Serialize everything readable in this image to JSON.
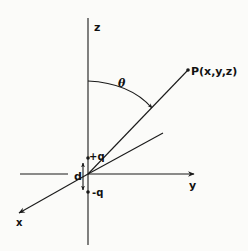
{
  "diagram": {
    "title": "",
    "labels": {
      "z_axis": "z",
      "y_axis": "y",
      "x_axis": "x",
      "point": "P(x,y,z)",
      "angle": "θ",
      "positive_charge": "+q",
      "negative_charge": "-q",
      "separation": "d"
    },
    "colors": {
      "ink": "#1a1a1a",
      "background": "#fbfbf9"
    },
    "elements": [
      {
        "id": "z-axis",
        "type": "axis",
        "label": "z"
      },
      {
        "id": "y-axis",
        "type": "axis",
        "label": "y"
      },
      {
        "id": "x-axis",
        "type": "axis",
        "label": "x"
      },
      {
        "id": "position-vector",
        "type": "line",
        "to": "P(x,y,z)"
      },
      {
        "id": "projection-line",
        "type": "line"
      },
      {
        "id": "theta-arc",
        "type": "arc",
        "label": "θ"
      },
      {
        "id": "charge-plus",
        "type": "point",
        "label": "+q"
      },
      {
        "id": "charge-minus",
        "type": "point",
        "label": "-q"
      },
      {
        "id": "dipole-separation",
        "type": "double-arrow",
        "label": "d"
      }
    ]
  }
}
